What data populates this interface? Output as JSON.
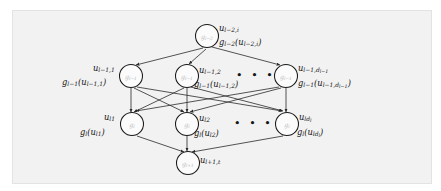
{
  "figure": {
    "kind": "layered-neural-network-diagram",
    "background_color": "#f2f2f2",
    "page_color": "#ffffff",
    "node_fill": "#fbfbfb",
    "node_stroke": "#1a1a1a",
    "edge_color": "#2a2a2a",
    "inner_label_color": "#b9b9b9",
    "text_color": "#141414",
    "ellipsis": "• • •"
  },
  "nodes": {
    "top": {
      "inner": "g",
      "inner_sub": "l−2",
      "var_label": "u",
      "var_sub": "l−2,i",
      "fn_label": "g",
      "fn_sub": "l−2",
      "fn_arg": "(u",
      "fn_arg_sub": "l−2,i",
      "fn_close": ")"
    },
    "middle": [
      {
        "inner": "g",
        "inner_sub": "l−1",
        "var_label": "u",
        "var_sub": "l−1,1",
        "fn_label": "g",
        "fn_sub": "l−1",
        "fn_arg": "(u",
        "fn_arg_sub": "l−1,1",
        "fn_close": ")"
      },
      {
        "inner": "g",
        "inner_sub": "l−1",
        "var_label": "u",
        "var_sub": "l−1,2",
        "fn_label": "g",
        "fn_sub": "l−1",
        "fn_arg": "(u",
        "fn_arg_sub": "l−1,2",
        "fn_close": ")"
      },
      {
        "inner": "g",
        "inner_sub": "l−1",
        "var_label": "u",
        "var_sub": "l−1,d",
        "var_sub_sub": "l−1",
        "fn_label": "g",
        "fn_sub": "l−1",
        "fn_arg": "(u",
        "fn_arg_sub": "l−1,d",
        "fn_arg_sub_sub": "l−1",
        "fn_close": ")"
      }
    ],
    "bottom": [
      {
        "inner": "g",
        "inner_sub": "l",
        "var_label": "u",
        "var_sub": "l1",
        "fn_label": "g",
        "fn_sub": "l",
        "fn_arg": "(u",
        "fn_arg_sub": "l1",
        "fn_close": ")"
      },
      {
        "inner": "g",
        "inner_sub": "l",
        "var_label": "u",
        "var_sub": "l2",
        "fn_label": "g",
        "fn_sub": "l",
        "fn_arg": "(u",
        "fn_arg_sub": "l2",
        "fn_close": ")"
      },
      {
        "inner": "g",
        "inner_sub": "l",
        "var_label": "u",
        "var_sub": "ld",
        "var_sub_sub": "l",
        "fn_label": "g",
        "fn_sub": "l",
        "fn_arg": "(u",
        "fn_arg_sub": "ld",
        "fn_arg_sub_sub": "l",
        "fn_close": ")"
      }
    ],
    "sink": {
      "inner": "g",
      "inner_sub": "l+1",
      "var_label": "u",
      "var_sub": "l+1,t"
    }
  }
}
